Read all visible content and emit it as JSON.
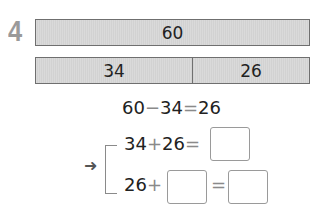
{
  "problem": {
    "number": "4",
    "bars": {
      "total": {
        "label": "60"
      },
      "parts": [
        {
          "label": "34"
        },
        {
          "label": "26"
        }
      ]
    },
    "equation_main": {
      "a": "60",
      "op": "−",
      "b": "34",
      "eq": "=",
      "result": "26"
    },
    "check": {
      "arrow": "➜",
      "line1": {
        "a": "34",
        "op": "+",
        "b": "26",
        "eq": "=",
        "answer": ""
      },
      "line2": {
        "a": "26",
        "op": "+",
        "blank": "",
        "eq": "=",
        "answer": ""
      }
    }
  }
}
